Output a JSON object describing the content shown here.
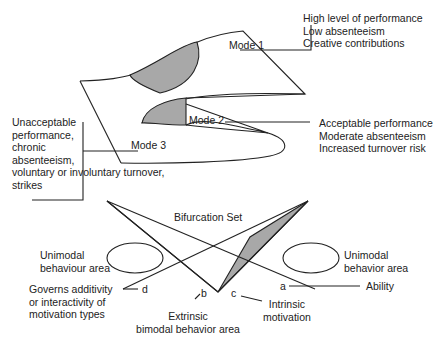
{
  "colors": {
    "fill": "#a8a8a8",
    "stroke": "#222222",
    "background": "#ffffff"
  },
  "surface": {
    "mode1": {
      "label": "Mode 1",
      "description": [
        "High level of performance",
        "Low absenteeism",
        "Creative contributions"
      ]
    },
    "mode2": {
      "label": "Mode 2",
      "description": [
        "Acceptable performance",
        "Moderate absenteeism",
        "Increased turnover risk"
      ]
    },
    "mode3": {
      "label": "Mode 3",
      "description": [
        "Unacceptable",
        "performance,",
        "chronic",
        "absenteeism,",
        "voluntary or involuntary turnover,",
        "strikes"
      ]
    }
  },
  "bifurcation": {
    "title": "Bifurcation Set",
    "left_area": [
      "Unimodal",
      "behaviour area"
    ],
    "right_area": [
      "Unimodal",
      "behavior area"
    ],
    "axis_a": {
      "letter": "a",
      "label": "Ability"
    },
    "axis_b": {
      "letter": "b",
      "label": [
        "Extrinsic",
        "bimodal behavior area"
      ]
    },
    "axis_c": {
      "letter": "c",
      "label": [
        "Intrinsic",
        "motivation"
      ]
    },
    "axis_d": {
      "letter": "d",
      "label": [
        "Governs additivity",
        "or interactivity of",
        "motivation types"
      ]
    }
  }
}
